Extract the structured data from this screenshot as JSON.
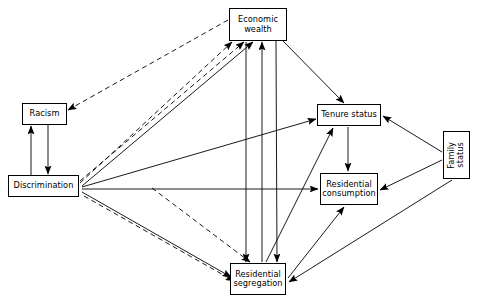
{
  "figure": {
    "type": "path-diagram",
    "background_color": "#ffffff",
    "line_color": "#000000",
    "width": 478,
    "height": 301
  },
  "nodes": [
    {
      "id": "economic_wealth",
      "label": "Economic\nwealth",
      "x": 229,
      "y": 8,
      "w": 58,
      "h": 33,
      "orientation": "horizontal"
    },
    {
      "id": "racism",
      "label": "Racism",
      "x": 22,
      "y": 103,
      "w": 45,
      "h": 22,
      "orientation": "horizontal"
    },
    {
      "id": "discrimination",
      "label": "Discrimination",
      "x": 8,
      "y": 175,
      "w": 71,
      "h": 22,
      "orientation": "horizontal"
    },
    {
      "id": "tenure_status",
      "label": "Tenure status",
      "x": 317,
      "y": 104,
      "w": 64,
      "h": 22,
      "orientation": "horizontal"
    },
    {
      "id": "residential_consumption",
      "label": "Residential\nconsumption",
      "x": 320,
      "y": 173,
      "w": 58,
      "h": 32,
      "orientation": "horizontal"
    },
    {
      "id": "residential_segregation",
      "label": "Residential\nsegregation",
      "x": 230,
      "y": 263,
      "w": 56,
      "h": 32,
      "orientation": "horizontal"
    },
    {
      "id": "family_status",
      "label": "Family\nstatus",
      "x": 443,
      "y": 131,
      "w": 27,
      "h": 48,
      "orientation": "vertical"
    }
  ],
  "edges": [
    {
      "id": "disc-racism",
      "from": "discrimination",
      "to": "racism",
      "style": "solid",
      "x1": 31,
      "y1": 175,
      "x2": 31,
      "y2": 126
    },
    {
      "id": "racism-disc",
      "from": "racism",
      "to": "discrimination",
      "style": "solid",
      "x1": 48,
      "y1": 125,
      "x2": 48,
      "y2": 174
    },
    {
      "id": "wealth-racism",
      "from": "economic_wealth",
      "to": "racism",
      "style": "dashed",
      "x1": 228,
      "y1": 20,
      "x2": 68,
      "y2": 110
    },
    {
      "id": "disc-wealth-dash-a",
      "from": "discrimination",
      "to": "economic_wealth",
      "style": "dashed",
      "x1": 80,
      "y1": 183,
      "x2": 232,
      "y2": 42
    },
    {
      "id": "disc-wealth-dash-b",
      "from": "discrimination",
      "to": "economic_wealth",
      "style": "dashed",
      "x1": 80,
      "y1": 181,
      "x2": 244,
      "y2": 42
    },
    {
      "id": "disc-wealth-solid",
      "from": "discrimination",
      "to": "economic_wealth",
      "style": "solid",
      "x1": 82,
      "y1": 186,
      "x2": 253,
      "y2": 42
    },
    {
      "id": "disc-tenure",
      "from": "discrimination",
      "to": "tenure_status",
      "style": "solid",
      "x1": 82,
      "y1": 187,
      "x2": 316,
      "y2": 119
    },
    {
      "id": "disc-consumption",
      "from": "discrimination",
      "to": "residential_consumption",
      "style": "solid",
      "x1": 82,
      "y1": 189,
      "x2": 318,
      "y2": 189
    },
    {
      "id": "disc-segregation-solid",
      "from": "discrimination",
      "to": "residential_segregation",
      "style": "solid",
      "x1": 82,
      "y1": 192,
      "x2": 231,
      "y2": 277
    },
    {
      "id": "disc-segregation-dash",
      "from": "discrimination",
      "to": "residential_segregation",
      "style": "dashed",
      "x1": 84,
      "y1": 196,
      "x2": 234,
      "y2": 281
    },
    {
      "id": "wealth-segregation-dash",
      "from": "economic_wealth",
      "to": "residential_segregation",
      "style": "dashed",
      "x1": 152,
      "y1": 188,
      "x2": 250,
      "y2": 262
    },
    {
      "id": "wealth-down-segregation",
      "from": "economic_wealth",
      "to": "residential_segregation",
      "style": "solid",
      "x1": 246,
      "y1": 42,
      "x2": 246,
      "y2": 262
    },
    {
      "id": "segregation-up-wealth",
      "from": "residential_segregation",
      "to": "economic_wealth",
      "style": "solid",
      "x1": 262,
      "y1": 262,
      "x2": 262,
      "y2": 42
    },
    {
      "id": "wealth-tenure",
      "from": "economic_wealth",
      "to": "tenure_status",
      "style": "solid",
      "x1": 283,
      "y1": 41,
      "x2": 344,
      "y2": 103
    },
    {
      "id": "wealth-segregation-diag",
      "from": "economic_wealth",
      "to": "residential_segregation",
      "style": "solid",
      "x1": 276,
      "y1": 41,
      "x2": 277,
      "y2": 262
    },
    {
      "id": "segregation-tenure",
      "from": "residential_segregation",
      "to": "tenure_status",
      "style": "solid",
      "x1": 266,
      "y1": 262,
      "x2": 333,
      "y2": 128
    },
    {
      "id": "tenure-consumption",
      "from": "tenure_status",
      "to": "residential_consumption",
      "style": "solid",
      "x1": 348,
      "y1": 127,
      "x2": 348,
      "y2": 171
    },
    {
      "id": "segregation-consumption",
      "from": "residential_segregation",
      "to": "residential_consumption",
      "style": "solid",
      "x1": 288,
      "y1": 278,
      "x2": 344,
      "y2": 207
    },
    {
      "id": "family-tenure",
      "from": "family_status",
      "to": "tenure_status",
      "style": "solid",
      "x1": 442,
      "y1": 152,
      "x2": 383,
      "y2": 116
    },
    {
      "id": "family-consumption",
      "from": "family_status",
      "to": "residential_consumption",
      "style": "solid",
      "x1": 442,
      "y1": 160,
      "x2": 380,
      "y2": 190
    },
    {
      "id": "family-segregation",
      "from": "family_status",
      "to": "residential_segregation",
      "style": "solid",
      "x1": 452,
      "y1": 180,
      "x2": 289,
      "y2": 282
    }
  ]
}
